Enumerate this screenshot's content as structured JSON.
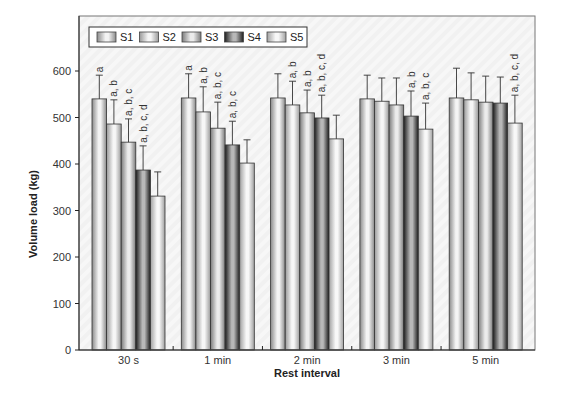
{
  "chart_data": {
    "type": "bar",
    "title": "",
    "xlabel": "Rest interval",
    "ylabel": "Volume load (kg)",
    "ylim": [
      0,
      660
    ],
    "yticks": [
      0,
      100,
      200,
      300,
      400,
      500,
      600
    ],
    "grid": false,
    "legend_position": "top-left (inside)",
    "categories": [
      "30 s",
      "1 min",
      "2 min",
      "3 min",
      "5 min"
    ],
    "series": [
      {
        "name": "S1",
        "values": [
          540,
          542,
          542,
          540,
          542
        ],
        "error": [
          51,
          52,
          52,
          51,
          64
        ],
        "labels": [
          "a",
          "a",
          "",
          "",
          ""
        ]
      },
      {
        "name": "S2",
        "values": [
          486,
          512,
          527,
          535,
          538
        ],
        "error": [
          52,
          54,
          51,
          50,
          58
        ],
        "labels": [
          "a, b",
          "a, b",
          "a, b",
          "",
          ""
        ]
      },
      {
        "name": "S3",
        "values": [
          447,
          477,
          510,
          527,
          533
        ],
        "error": [
          50,
          56,
          49,
          58,
          56
        ],
        "labels": [
          "a, b, c",
          "a, b, c",
          "a, b",
          "",
          ""
        ]
      },
      {
        "name": "S4",
        "values": [
          387,
          441,
          499,
          503,
          531
        ],
        "error": [
          52,
          51,
          49,
          54,
          56
        ],
        "labels": [
          "a, b, c, d",
          "a, b, c",
          "a, b, c, d",
          "a, b",
          ""
        ]
      },
      {
        "name": "S5",
        "values": [
          331,
          402,
          454,
          475,
          488
        ],
        "error": [
          52,
          50,
          51,
          56,
          60
        ],
        "labels": [
          "",
          "",
          "",
          "a, b, c",
          "a, b, c, d"
        ]
      }
    ],
    "series_colors": {
      "S1": {
        "edge": "#8a8a8a",
        "center": "#f4f4f4"
      },
      "S2": {
        "edge": "#9a9a9a",
        "center": "#f6f6f6"
      },
      "S3": {
        "edge": "#7c7c7c",
        "center": "#ececec"
      },
      "S4": {
        "edge": "#1e1e1e",
        "center": "#b8b8b8"
      },
      "S5": {
        "edge": "#a0a0a0",
        "center": "#f8f8f8"
      }
    }
  }
}
